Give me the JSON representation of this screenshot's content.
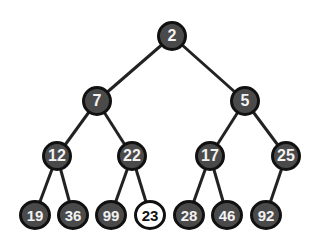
{
  "diagram": {
    "type": "binary-min-heap",
    "nodes": [
      {
        "id": "n0",
        "label": "2",
        "x": 172,
        "y": 36
      },
      {
        "id": "n1",
        "label": "7",
        "x": 97,
        "y": 101
      },
      {
        "id": "n2",
        "label": "5",
        "x": 245,
        "y": 101
      },
      {
        "id": "n3",
        "label": "12",
        "x": 57,
        "y": 156
      },
      {
        "id": "n4",
        "label": "22",
        "x": 132,
        "y": 156
      },
      {
        "id": "n5",
        "label": "17",
        "x": 210,
        "y": 156
      },
      {
        "id": "n6",
        "label": "25",
        "x": 286,
        "y": 156
      },
      {
        "id": "n7",
        "label": "19",
        "x": 35,
        "y": 215
      },
      {
        "id": "n8",
        "label": "36",
        "x": 73,
        "y": 215
      },
      {
        "id": "n9",
        "label": "99",
        "x": 111,
        "y": 215
      },
      {
        "id": "n10",
        "label": "23",
        "x": 150,
        "y": 215,
        "highlighted": true
      },
      {
        "id": "n11",
        "label": "28",
        "x": 189,
        "y": 215
      },
      {
        "id": "n12",
        "label": "46",
        "x": 227,
        "y": 215
      },
      {
        "id": "n13",
        "label": "92",
        "x": 266,
        "y": 215
      }
    ],
    "edges": [
      [
        "n0",
        "n1"
      ],
      [
        "n0",
        "n2"
      ],
      [
        "n1",
        "n3"
      ],
      [
        "n1",
        "n4"
      ],
      [
        "n2",
        "n5"
      ],
      [
        "n2",
        "n6"
      ],
      [
        "n3",
        "n7"
      ],
      [
        "n3",
        "n8"
      ],
      [
        "n4",
        "n9"
      ],
      [
        "n4",
        "n10"
      ],
      [
        "n5",
        "n11"
      ],
      [
        "n5",
        "n12"
      ],
      [
        "n6",
        "n13"
      ]
    ],
    "colors": {
      "node_fill": "#4a4a4a",
      "node_border": "#111111",
      "highlight_fill": "#ffffff",
      "edge": "#222222"
    }
  }
}
